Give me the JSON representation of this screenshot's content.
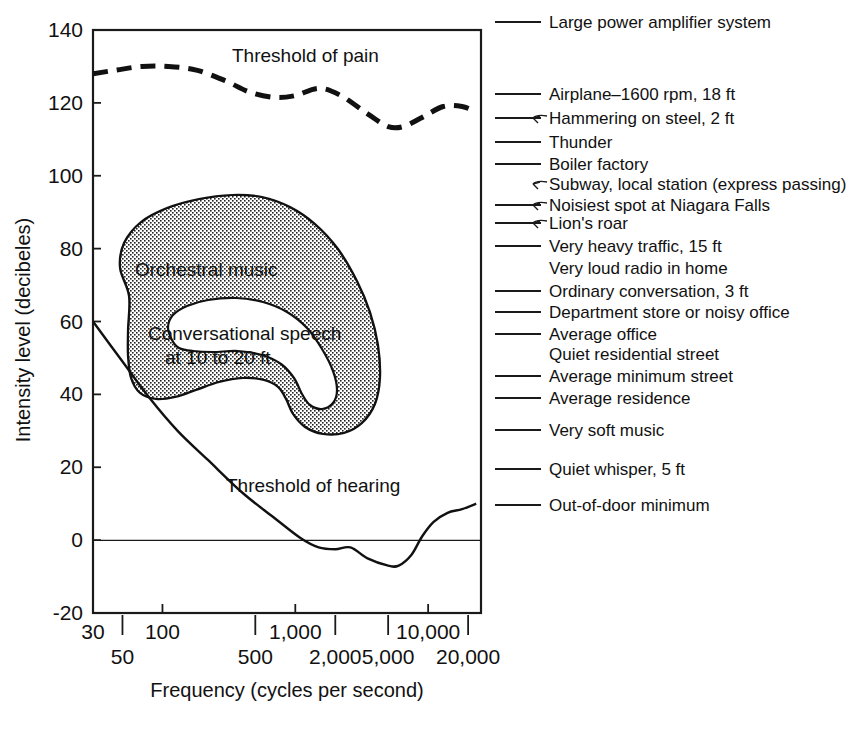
{
  "chart_data": {
    "type": "line",
    "title": "",
    "xlabel": "Frequency   (cycles per second)",
    "ylabel": "Intensity level   (decibeles)",
    "xscale": "log",
    "xlim": [
      30,
      25000
    ],
    "ylim": [
      -20,
      140
    ],
    "grid": false,
    "legend_position": "right-side scale of reference sounds",
    "yticks": [
      "140",
      "120",
      "100",
      "80",
      "60",
      "40",
      "20",
      "0",
      "-20"
    ],
    "ytick_values": [
      140,
      120,
      100,
      80,
      60,
      40,
      20,
      0,
      -20
    ],
    "xticks_upper": [
      "30",
      "100",
      "1,000",
      "10,000"
    ],
    "xtick_upper_values": [
      30,
      100,
      1000,
      10000
    ],
    "xticks_lower": [
      "50",
      "500",
      "2,000",
      "5,000",
      "20,000"
    ],
    "xtick_lower_values": [
      50,
      500,
      2000,
      5000,
      20000
    ],
    "series": [
      {
        "name": "Threshold of pain",
        "style": "dashed",
        "points": [
          [
            30,
            128
          ],
          [
            45,
            129
          ],
          [
            70,
            130
          ],
          [
            110,
            130
          ],
          [
            180,
            129
          ],
          [
            300,
            126
          ],
          [
            450,
            123
          ],
          [
            700,
            121.5
          ],
          [
            1000,
            122
          ],
          [
            1500,
            124
          ],
          [
            2200,
            122
          ],
          [
            3500,
            117
          ],
          [
            5000,
            113.5
          ],
          [
            6500,
            113.5
          ],
          [
            9000,
            116
          ],
          [
            13000,
            119
          ],
          [
            18000,
            119
          ],
          [
            23000,
            117.5
          ]
        ]
      },
      {
        "name": "Threshold of hearing",
        "style": "solid",
        "points": [
          [
            30,
            60
          ],
          [
            50,
            49
          ],
          [
            80,
            39
          ],
          [
            130,
            30
          ],
          [
            220,
            22
          ],
          [
            400,
            13
          ],
          [
            700,
            6
          ],
          [
            1100,
            0.5
          ],
          [
            1500,
            -2
          ],
          [
            2000,
            -2.5
          ],
          [
            2600,
            -2
          ],
          [
            3500,
            -5
          ],
          [
            5000,
            -7
          ],
          [
            6000,
            -7
          ],
          [
            7500,
            -4
          ],
          [
            9000,
            1
          ],
          [
            11000,
            5
          ],
          [
            14000,
            7.5
          ],
          [
            18000,
            8.5
          ],
          [
            23000,
            10
          ]
        ]
      }
    ],
    "regions": [
      {
        "name": "Orchestral music",
        "label": "Orchestral music",
        "fill": "stipple",
        "approx_range_db": [
          25,
          92
        ],
        "approx_range_hz": [
          40,
          15000
        ]
      },
      {
        "name": "Conversational speech",
        "label": "Conversational speech\nat 10 to 20 ft",
        "label_line1": "Conversational speech",
        "label_line2": "at 10 to 20 ft",
        "fill": "white",
        "approx_range_db": [
          38,
          68
        ],
        "approx_range_hz": [
          120,
          9000
        ]
      }
    ],
    "reference_scale": [
      {
        "label": "Large power amplifier system",
        "db": 140,
        "tick": true,
        "leader": false
      },
      {
        "label": "Airplane–1600 rpm, 18 ft",
        "db": 120,
        "tick": true,
        "leader": false
      },
      {
        "label": "Hammering on steel, 2 ft",
        "db": 114,
        "tick": true,
        "leader": true
      },
      {
        "label": "Thunder",
        "db": 110,
        "tick": true,
        "leader": false
      },
      {
        "label": "Boiler factory",
        "db": 104,
        "tick": true,
        "leader": false
      },
      {
        "label": "Subway, local station (express passing)",
        "db": 99,
        "tick": false,
        "leader": true
      },
      {
        "label": "Noisiest spot at Niagara Falls",
        "db": 92,
        "tick": true,
        "leader": true
      },
      {
        "label": "Lion's roar",
        "db": 88,
        "tick": true,
        "leader": true
      },
      {
        "label": "Very heavy traffic, 15 ft",
        "db": 80,
        "tick": true,
        "leader": false
      },
      {
        "label": "Very loud radio in home",
        "db": 74,
        "tick": false,
        "leader": false
      },
      {
        "label": "Ordinary conversation, 3 ft",
        "db": 66,
        "tick": true,
        "leader": false
      },
      {
        "label": "Department store or noisy office",
        "db": 60,
        "tick": true,
        "leader": false
      },
      {
        "label": "Average office",
        "db": 53,
        "tick": true,
        "leader": false
      },
      {
        "label": "Quiet residential street",
        "db": 47,
        "tick": false,
        "leader": false
      },
      {
        "label": "Average minimum street",
        "db": 40,
        "tick": true,
        "leader": false
      },
      {
        "label": "Average residence",
        "db": 33,
        "tick": true,
        "leader": false
      },
      {
        "label": "Very soft music",
        "db": 23,
        "tick": true,
        "leader": false
      },
      {
        "label": "Quiet whisper, 5 ft",
        "db": 11,
        "tick": true,
        "leader": false
      },
      {
        "label": "Out-of-door minimum",
        "db": 0,
        "tick": true,
        "leader": false
      }
    ]
  },
  "colors": {
    "ink": "#111111",
    "paper": "#ffffff",
    "stipple": "#111111"
  }
}
